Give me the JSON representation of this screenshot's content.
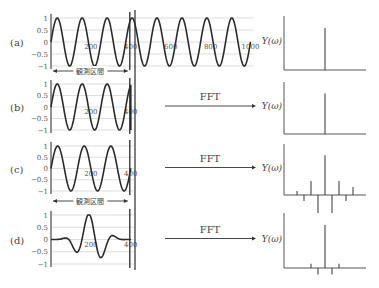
{
  "figure": {
    "panels": [
      {
        "id": "a",
        "label": "(a)",
        "yticks": [
          "1",
          "0.5",
          "0",
          "−0.5",
          "−1"
        ],
        "xticks": [
          "200",
          "400",
          "600",
          "800",
          "1000"
        ],
        "spectrum_label": "Y(ω)",
        "fft_label": ""
      },
      {
        "id": "b",
        "label": "(b)",
        "yticks": [
          "1",
          "0.5",
          "0",
          "−0.5",
          "−1"
        ],
        "xticks": [
          "200",
          "400"
        ],
        "spectrum_label": "Y(ω)",
        "fft_label": "FFT"
      },
      {
        "id": "c",
        "label": "(c)",
        "yticks": [
          "1",
          "0.5",
          "0",
          "−0.5",
          "−1"
        ],
        "xticks": [
          "200",
          "400"
        ],
        "spectrum_label": "Y(ω)",
        "fft_label": "FFT"
      },
      {
        "id": "d",
        "label": "(d)",
        "yticks": [
          "1",
          "0.5",
          "0",
          "−0.5",
          "−1"
        ],
        "xticks": [
          "200",
          "400"
        ],
        "spectrum_label": "Y(ω)",
        "fft_label": "FFT"
      }
    ],
    "interval_label": "観測区間",
    "colors": {
      "wave": "#2b2b2b",
      "grid": "#cfcfcf",
      "axis": "#555555",
      "spectrum": "#444444"
    }
  },
  "chart_data": [
    {
      "type": "line",
      "title": "(a) continuous sinusoid",
      "x_range": [
        0,
        1000
      ],
      "ylim": [
        -1,
        1
      ],
      "period": 125,
      "observation_interval": [
        0,
        400
      ],
      "grid": true
    },
    {
      "type": "line",
      "title": "(b) truncated sinusoid (non-integer periods)",
      "x_range": [
        0,
        400
      ],
      "ylim": [
        -1,
        1
      ],
      "period": 125
    },
    {
      "type": "line",
      "title": "(c) truncated sinusoid (integer periods)",
      "x_range": [
        0,
        400
      ],
      "ylim": [
        -1,
        1
      ],
      "period": 133.3
    },
    {
      "type": "line",
      "title": "(d) windowed sinusoid",
      "x_range": [
        0,
        400
      ],
      "ylim": [
        -1,
        1
      ],
      "period": 133.3,
      "window": "bell"
    },
    {
      "type": "bar",
      "title": "Y(ω) (a)",
      "bins": [
        0
      ],
      "values": [
        1.0
      ]
    },
    {
      "type": "bar",
      "title": "Y(ω) (b)",
      "bins": [
        0
      ],
      "values": [
        1.0
      ]
    },
    {
      "type": "bar",
      "title": "Y(ω) (c)",
      "bins": [
        -4,
        -3,
        -2,
        -1,
        0,
        1,
        2,
        3,
        4
      ],
      "values": [
        0.1,
        -0.15,
        0.35,
        -0.45,
        1.0,
        -0.45,
        0.35,
        -0.15,
        0.2
      ]
    },
    {
      "type": "bar",
      "title": "Y(ω) (d)",
      "bins": [
        -2,
        -1,
        0,
        1,
        2
      ],
      "values": [
        0.1,
        -0.15,
        1.0,
        -0.15,
        0.1
      ]
    }
  ]
}
